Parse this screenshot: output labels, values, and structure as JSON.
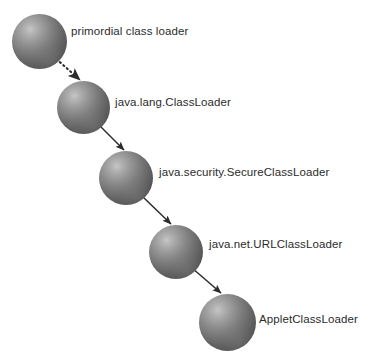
{
  "diagram": {
    "background_color": "#ffffff",
    "label_color": "#2b2b2b",
    "sphere_colors": {
      "highlight": "#c6c6c6",
      "midtone": "#848484",
      "shadow": "#3d3d3d"
    },
    "arrow_color": "#2b2b2b",
    "nodes": [
      {
        "id": "primordial",
        "label": "primordial class loader",
        "sphere": {
          "x": 12,
          "y": 14,
          "size": 55
        },
        "label_pos": {
          "x": 71,
          "y": 26
        }
      },
      {
        "id": "java-lang-classloader",
        "label": "java.lang.ClassLoader",
        "sphere": {
          "x": 57,
          "y": 81,
          "size": 53
        },
        "label_pos": {
          "x": 115,
          "y": 97
        }
      },
      {
        "id": "java-security-secureclassloader",
        "label": "java.security.SecureClassLoader",
        "sphere": {
          "x": 99,
          "y": 151,
          "size": 54
        },
        "label_pos": {
          "x": 159,
          "y": 167
        }
      },
      {
        "id": "java-net-urlclassloader",
        "label": "java.net.URLClassLoader",
        "sphere": {
          "x": 149,
          "y": 225,
          "size": 54
        },
        "label_pos": {
          "x": 209,
          "y": 239
        }
      },
      {
        "id": "appletclassloader",
        "label": "AppletClassLoader",
        "sphere": {
          "x": 199,
          "y": 294,
          "size": 57
        },
        "label_pos": {
          "x": 259,
          "y": 314
        }
      }
    ],
    "connectors": [
      {
        "id": "primordial-to-classloader",
        "style": "dotted",
        "from": "primordial",
        "to": "java-lang-classloader",
        "x1": 53,
        "y1": 56,
        "x2": 80,
        "y2": 80
      },
      {
        "id": "classloader-to-secureclassloader",
        "style": "solid",
        "from": "java-lang-classloader",
        "to": "java-security-secureclassloader",
        "x1": 99,
        "y1": 125,
        "x2": 124,
        "y2": 150
      },
      {
        "id": "secureclassloader-to-urlclassloader",
        "style": "solid",
        "from": "java-security-secureclassloader",
        "to": "java-net-urlclassloader",
        "x1": 143,
        "y1": 197,
        "x2": 171,
        "y2": 224
      },
      {
        "id": "urlclassloader-to-appletclassloader",
        "style": "solid",
        "from": "java-net-urlclassloader",
        "to": "appletclassloader",
        "x1": 192,
        "y1": 268,
        "x2": 221,
        "y2": 293
      }
    ]
  }
}
